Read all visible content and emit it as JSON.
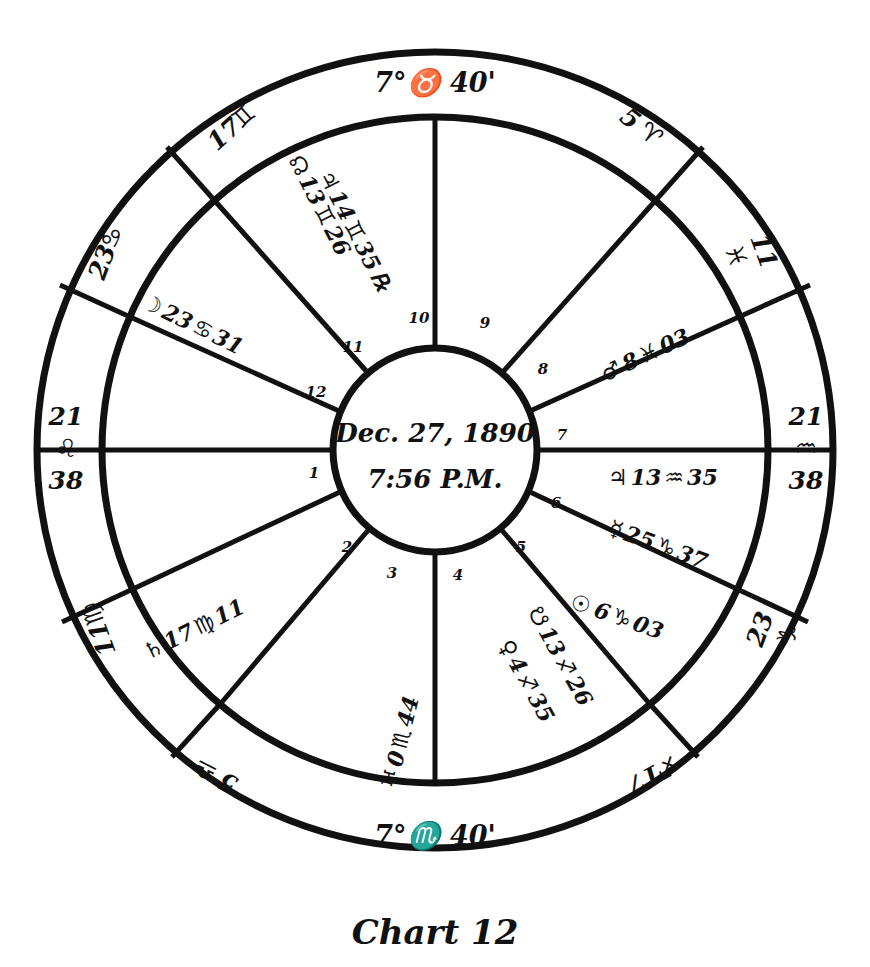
{
  "caption": "Chart 12",
  "center": {
    "date": "Dec. 27, 1890",
    "time": "7:56 P.M."
  },
  "angles": {
    "mc": "7°♉ 40'",
    "ic": "7°♏ 40'",
    "asc_deg": "21",
    "asc_sign": "♌",
    "asc_min": "38",
    "desc_deg": "21",
    "desc_sign": "♒",
    "desc_min": "38"
  },
  "cusps": [
    {
      "id": "cusp-11",
      "deg": "17",
      "sign": "♊"
    },
    {
      "id": "cusp-12",
      "deg": "23",
      "sign": "♋"
    },
    {
      "id": "cusp-2",
      "deg": "11",
      "sign": "♍"
    },
    {
      "id": "cusp-3",
      "deg": "5",
      "sign": "♎"
    },
    {
      "id": "cusp-5",
      "deg": "17",
      "sign": "♐"
    },
    {
      "id": "cusp-6",
      "deg": "23",
      "sign": "♑"
    },
    {
      "id": "cusp-8",
      "deg": "11",
      "sign": "♓"
    },
    {
      "id": "cusp-9",
      "deg": "5",
      "sign": "♈"
    }
  ],
  "house_numbers": [
    "1",
    "2",
    "3",
    "4",
    "5",
    "6",
    "7",
    "8",
    "9",
    "10",
    "11",
    "12"
  ],
  "planets": [
    {
      "id": "jupiter",
      "glyph": "♃",
      "name": "Jupiter",
      "deg": "14",
      "sign": "♊",
      "min": "35",
      "retro": "℞"
    },
    {
      "id": "north-node",
      "glyph": "☊",
      "name": "North Node",
      "deg": "13",
      "sign": "♊",
      "min": "26",
      "retro": ""
    },
    {
      "id": "moon",
      "glyph": "☽",
      "name": "Moon",
      "deg": "23",
      "sign": "♋",
      "min": "31",
      "retro": ""
    },
    {
      "id": "saturn",
      "glyph": "♄",
      "name": "Saturn",
      "deg": "17",
      "sign": "♍",
      "min": "11",
      "retro": ""
    },
    {
      "id": "uranus",
      "glyph": "♅",
      "name": "Uranus",
      "deg": "0",
      "sign": "♏",
      "min": "44",
      "retro": ""
    },
    {
      "id": "south-node",
      "glyph": "☋",
      "name": "South Node",
      "deg": "13",
      "sign": "♐",
      "min": "26",
      "retro": ""
    },
    {
      "id": "venus",
      "glyph": "♀",
      "name": "Venus",
      "deg": "4",
      "sign": "♐",
      "min": "35",
      "retro": ""
    },
    {
      "id": "sun",
      "glyph": "☉",
      "name": "Sun",
      "deg": "6",
      "sign": "♑",
      "min": "03",
      "retro": ""
    },
    {
      "id": "mercury",
      "glyph": "☿",
      "name": "Mercury",
      "deg": "25",
      "sign": "♑",
      "min": "37",
      "retro": ""
    },
    {
      "id": "jupiter2",
      "glyph": "♃",
      "name": "Jupiter",
      "deg": "13",
      "sign": "♒",
      "min": "35",
      "retro": ""
    },
    {
      "id": "mars",
      "glyph": "♂",
      "name": "Mars",
      "deg": "8",
      "sign": "♓",
      "min": "03",
      "retro": ""
    }
  ],
  "colors": {
    "ink": "#111111",
    "paper": "#ffffff"
  }
}
